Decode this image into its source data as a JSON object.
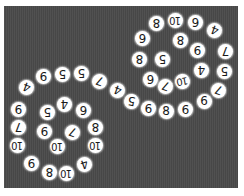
{
  "board": {
    "background": "#4a4a4a",
    "tile_color": "#ffffff",
    "tiles": [
      {
        "v": "4",
        "x": 26,
        "y": 87,
        "r": 200
      },
      {
        "v": "9",
        "x": 43,
        "y": 76,
        "r": 180
      },
      {
        "v": "5",
        "x": 62,
        "y": 74,
        "r": 180
      },
      {
        "v": "5",
        "x": 81,
        "y": 73,
        "r": 180
      },
      {
        "v": "7",
        "x": 99,
        "y": 81,
        "r": 200
      },
      {
        "v": "4",
        "x": 117,
        "y": 90,
        "r": 200
      },
      {
        "v": "5",
        "x": 131,
        "y": 101,
        "r": 190
      },
      {
        "v": "9",
        "x": 148,
        "y": 108,
        "r": 180
      },
      {
        "v": "8",
        "x": 166,
        "y": 111,
        "r": 0
      },
      {
        "v": "9",
        "x": 185,
        "y": 109,
        "r": 180
      },
      {
        "v": "6",
        "x": 204,
        "y": 101,
        "r": 0
      },
      {
        "v": "9",
        "x": 18,
        "y": 109,
        "r": 180
      },
      {
        "v": "7",
        "x": 18,
        "y": 127,
        "r": 180
      },
      {
        "v": "10",
        "x": 17,
        "y": 145,
        "r": 180
      },
      {
        "v": "9",
        "x": 31,
        "y": 163,
        "r": 180
      },
      {
        "v": "8",
        "x": 49,
        "y": 172,
        "r": 180
      },
      {
        "v": "10",
        "x": 66,
        "y": 173,
        "r": 180
      },
      {
        "v": "4",
        "x": 84,
        "y": 164,
        "r": 160
      },
      {
        "v": "10",
        "x": 95,
        "y": 145,
        "r": 180
      },
      {
        "v": "8",
        "x": 95,
        "y": 127,
        "r": 180
      },
      {
        "v": "6",
        "x": 83,
        "y": 110,
        "r": 180
      },
      {
        "v": "4",
        "x": 64,
        "y": 104,
        "r": 180
      },
      {
        "v": "5",
        "x": 47,
        "y": 112,
        "r": 180
      },
      {
        "v": "9",
        "x": 44,
        "y": 131,
        "r": 180
      },
      {
        "v": "10",
        "x": 57,
        "y": 146,
        "r": 180
      },
      {
        "v": "7",
        "x": 72,
        "y": 132,
        "r": 200
      },
      {
        "v": "8",
        "x": 156,
        "y": 23,
        "r": 180
      },
      {
        "v": "10",
        "x": 175,
        "y": 20,
        "r": 180
      },
      {
        "v": "6",
        "x": 195,
        "y": 22,
        "r": 180
      },
      {
        "v": "4",
        "x": 214,
        "y": 30,
        "r": 200
      },
      {
        "v": "7",
        "x": 225,
        "y": 51,
        "r": 180
      },
      {
        "v": "5",
        "x": 224,
        "y": 71,
        "r": 180
      },
      {
        "v": "7",
        "x": 218,
        "y": 90,
        "r": 200
      },
      {
        "v": "6",
        "x": 142,
        "y": 38,
        "r": 180
      },
      {
        "v": "8",
        "x": 139,
        "y": 59,
        "r": 180
      },
      {
        "v": "6",
        "x": 150,
        "y": 79,
        "r": 180
      },
      {
        "v": "7",
        "x": 165,
        "y": 86,
        "r": 200
      },
      {
        "v": "10",
        "x": 182,
        "y": 81,
        "r": 170
      },
      {
        "v": "4",
        "x": 201,
        "y": 70,
        "r": 180
      },
      {
        "v": "9",
        "x": 197,
        "y": 50,
        "r": 180
      },
      {
        "v": "8",
        "x": 180,
        "y": 40,
        "r": 180
      },
      {
        "v": "5",
        "x": 162,
        "y": 59,
        "r": 180
      }
    ]
  }
}
